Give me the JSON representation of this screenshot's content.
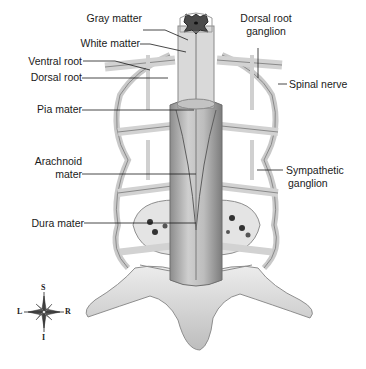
{
  "figure": {
    "labels_left": [
      {
        "id": "gray_matter",
        "text": "Gray matter"
      },
      {
        "id": "white_matter",
        "text": "White matter"
      },
      {
        "id": "ventral_root",
        "text": "Ventral root"
      },
      {
        "id": "dorsal_root",
        "text": "Dorsal root"
      },
      {
        "id": "pia_mater",
        "text": "Pia mater"
      },
      {
        "id": "arachnoid_mater_1",
        "text": "Arachnoid"
      },
      {
        "id": "arachnoid_mater_2",
        "text": "mater"
      },
      {
        "id": "dura_mater",
        "text": "Dura mater"
      }
    ],
    "labels_right": [
      {
        "id": "dorsal_root_ganglion_1",
        "text": "Dorsal root"
      },
      {
        "id": "dorsal_root_ganglion_2",
        "text": "ganglion"
      },
      {
        "id": "spinal_nerve",
        "text": "Spinal nerve"
      },
      {
        "id": "sympathetic_ganglion_1",
        "text": "Sympathetic"
      },
      {
        "id": "sympathetic_ganglion_2",
        "text": "ganglion"
      }
    ],
    "compass": {
      "top": "S",
      "bottom": "I",
      "left": "L",
      "right": "R"
    },
    "colors": {
      "background": "#ffffff",
      "cord": "#b9b9b9",
      "gray_matter": "#4a4a4a",
      "nerve": "#d4d4d4",
      "bone": "#e2e2e2",
      "leader_line": "#1a1a1a"
    }
  }
}
